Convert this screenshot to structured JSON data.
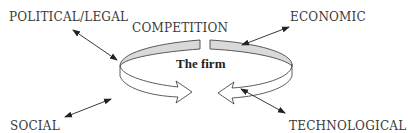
{
  "diagram": {
    "center": {
      "label": "The firm"
    },
    "ring_label": "COMPETITION",
    "forces": [
      {
        "id": "political",
        "label": "POLITICAL/LEGAL",
        "position": "top-left"
      },
      {
        "id": "economic",
        "label": "ECONOMIC",
        "position": "top-right"
      },
      {
        "id": "social",
        "label": "SOCIAL",
        "position": "bottom-left"
      },
      {
        "id": "technological",
        "label": "TECHNOLOGICAL",
        "position": "bottom-right"
      }
    ],
    "colors": {
      "text": "#3a3a3a",
      "ring_fill": "#d9d9d9",
      "stroke": "#333333"
    }
  }
}
